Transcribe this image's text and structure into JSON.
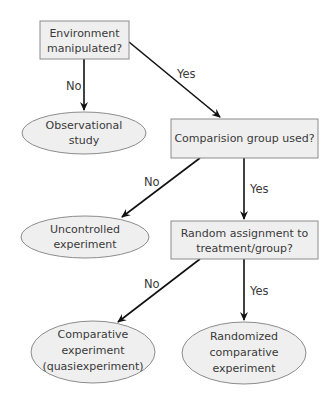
{
  "diagram": {
    "type": "flowchart",
    "colors": {
      "node_fill": "#efefef",
      "node_stroke": "#8c8c8c",
      "edge": "#111111",
      "text": "#3a3a3a"
    },
    "nodes": {
      "env": {
        "shape": "rect",
        "lines": [
          "Environment",
          "manipulated?"
        ]
      },
      "observational": {
        "shape": "ellipse",
        "lines": [
          "Observational",
          "study"
        ]
      },
      "comparison": {
        "shape": "rect",
        "lines": [
          "Comparision group used?"
        ]
      },
      "uncontrolled": {
        "shape": "ellipse",
        "lines": [
          "Uncontrolled",
          "experiment"
        ]
      },
      "random": {
        "shape": "rect",
        "lines": [
          "Random assignment to",
          "treatment/group?"
        ]
      },
      "comparative": {
        "shape": "ellipse",
        "lines": [
          "Comparative",
          "experiment",
          "(quasiexperiment)"
        ]
      },
      "randomized": {
        "shape": "ellipse",
        "lines": [
          "Randomized",
          "comparative",
          "experiment"
        ]
      }
    },
    "edges": [
      {
        "from": "env",
        "to": "observational",
        "label": "No"
      },
      {
        "from": "env",
        "to": "comparison",
        "label": "Yes"
      },
      {
        "from": "comparison",
        "to": "uncontrolled",
        "label": "No"
      },
      {
        "from": "comparison",
        "to": "random",
        "label": "Yes"
      },
      {
        "from": "random",
        "to": "comparative",
        "label": "No"
      },
      {
        "from": "random",
        "to": "randomized",
        "label": "Yes"
      }
    ]
  }
}
